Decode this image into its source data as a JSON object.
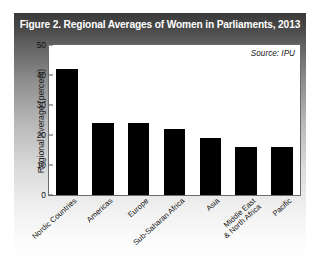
{
  "figure": {
    "title": "Figure 2. Regional Averages of Women in Parliaments, 2013",
    "source_note": "Source: IPU"
  },
  "chart_data": {
    "type": "bar",
    "title": "Figure 2. Regional Averages of Women in Parliaments, 2013",
    "xlabel": "",
    "ylabel": "Regional Average (percent)",
    "ylim": [
      0,
      50
    ],
    "yticks": [
      0,
      10,
      20,
      30,
      40,
      50
    ],
    "grid": false,
    "legend": "none",
    "annotations": [
      "Source: IPU"
    ],
    "bar_color": "#000000",
    "categories": [
      "Nordic Countries",
      "Americas",
      "Europe",
      "Sub-Saharan Africa",
      "Asia",
      "Middle East\n& North Africa",
      "Pacific"
    ],
    "values": [
      42,
      24,
      24,
      22,
      19,
      16,
      16
    ]
  }
}
